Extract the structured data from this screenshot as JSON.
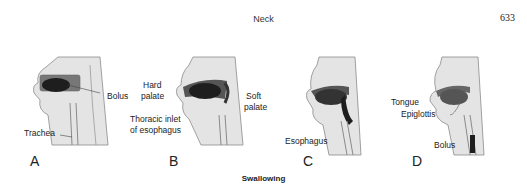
{
  "header": {
    "title": "Neck",
    "page_number": "633"
  },
  "figure": {
    "caption": "Swallowing",
    "panels": [
      {
        "letter": "A",
        "labels": [
          "Bolus",
          "Trachea"
        ]
      },
      {
        "letter": "B",
        "labels": [
          "Hard",
          "palate",
          "Soft",
          "palate",
          "Thoracic inlet",
          "of esophagus"
        ]
      },
      {
        "letter": "C",
        "labels": [
          "Esophagus"
        ]
      },
      {
        "letter": "D",
        "labels": [
          "Tongue",
          "Epiglottis",
          "Bolus"
        ]
      }
    ]
  },
  "colors": {
    "skin": "#e4e4e4",
    "outline": "#8a8a8a",
    "cavity": "#5a5a5a",
    "bolus": "#1e1e1e"
  }
}
